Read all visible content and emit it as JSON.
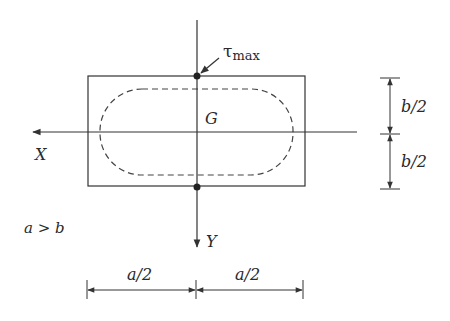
{
  "diagram": {
    "title": "",
    "labels": {
      "tau": "τ",
      "tau_sub": "max",
      "centroid": "G",
      "x_axis": "X",
      "y_axis": "Y",
      "condition": "a > b",
      "dim_a_left": "a/2",
      "dim_a_right": "a/2",
      "dim_b_top": "b/2",
      "dim_b_bottom": "b/2"
    },
    "colors": {
      "line": "#333333",
      "text": "#2a2a2a",
      "background": "#ffffff"
    }
  }
}
